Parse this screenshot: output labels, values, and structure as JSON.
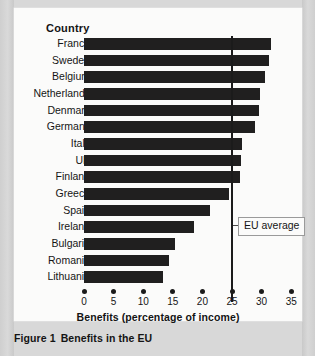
{
  "figure": {
    "caption_number": "Figure 1",
    "caption_text": "Benefits in the EU"
  },
  "chart_data": {
    "type": "bar",
    "orientation": "horizontal",
    "title": "",
    "category_axis_header": "Country",
    "xlabel": "Benefits (percentage of income)",
    "ylabel": "Country",
    "xlim": [
      0,
      35
    ],
    "xticks": [
      0,
      5,
      10,
      15,
      20,
      25,
      30,
      35
    ],
    "xtick_labels": [
      "0",
      "5",
      "10",
      "15",
      "20",
      "25",
      "30",
      "35"
    ],
    "grid": false,
    "legend": false,
    "bar_color": "#201f1f",
    "categories": [
      "France",
      "Sweden",
      "Belgium",
      "Netherlands",
      "Denmark",
      "Germany",
      "Italy",
      "UK",
      "Finland",
      "Greece",
      "Spain",
      "Ireland",
      "Bulgaria",
      "Romania",
      "Lithuania"
    ],
    "values": [
      31.6,
      31.3,
      30.6,
      29.8,
      29.6,
      28.9,
      26.7,
      26.5,
      26.4,
      24.5,
      21.3,
      18.5,
      15.3,
      14.3,
      13.4
    ],
    "annotations": [
      {
        "label": "EU average",
        "type": "vertical-reference-line",
        "value": 25,
        "color": "#1b1b1b"
      }
    ]
  }
}
